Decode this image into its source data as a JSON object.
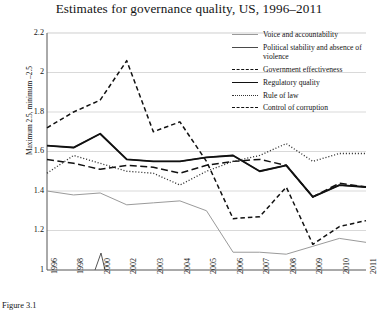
{
  "figure": {
    "caption": "Figure 3.1",
    "title": "Estimates for governance quality, US, 1996–2011"
  },
  "axes": {
    "ylabel": "Maximum 2.5, minimum –2.5",
    "yticks": [
      "2.2",
      "2",
      "1.8",
      "1.6",
      "1.4",
      "1.2",
      "1"
    ],
    "xticks": [
      "1996",
      "1998",
      "2000",
      "2002",
      "2003",
      "2004",
      "2005",
      "2006",
      "2007",
      "2008",
      "2009",
      "2010",
      "2011"
    ],
    "axis_break_marker": "zigzag"
  },
  "chart_data": {
    "type": "line",
    "title": "Estimates for governance quality, US, 1996–2011",
    "xlabel": "",
    "ylabel": "Maximum 2.5, minimum –2.5",
    "ylim": [
      1,
      2.2
    ],
    "ytick_values": [
      2.2,
      2.0,
      1.8,
      1.6,
      1.4,
      1.2,
      1.0
    ],
    "grid": "horizontal",
    "legend_position": "top-right inside",
    "categories": [
      "1996",
      "1998",
      "2000",
      "2002",
      "2003",
      "2004",
      "2005",
      "2006",
      "2007",
      "2008",
      "2009",
      "2010",
      "2011"
    ],
    "series": [
      {
        "name": "Voice and accountability",
        "style": "solid",
        "color": "#9a9a9a",
        "width": 1.0,
        "values": [
          1.4,
          1.38,
          1.39,
          1.33,
          1.34,
          1.35,
          1.3,
          1.09,
          1.09,
          1.08,
          1.12,
          1.16,
          1.14
        ]
      },
      {
        "name": "Political stability and absence of violence",
        "style": "solid",
        "color": "#4a4a4a",
        "width": 1.3,
        "values": [
          1.63,
          1.62,
          1.69,
          1.56,
          1.55,
          1.55,
          1.57,
          1.58,
          1.5,
          1.53,
          1.37,
          1.43,
          1.42
        ]
      },
      {
        "name": "Government effectiveness",
        "style": "dashed-long",
        "color": "#111111",
        "width": 1.5,
        "values": [
          1.56,
          1.54,
          1.51,
          1.53,
          1.52,
          1.49,
          1.53,
          1.55,
          1.56,
          1.53,
          1.37,
          1.44,
          1.42
        ]
      },
      {
        "name": "Regulatory quality",
        "style": "solid",
        "color": "#111111",
        "width": 1.9,
        "values": [
          1.63,
          1.62,
          1.69,
          1.56,
          1.55,
          1.55,
          1.57,
          1.58,
          1.5,
          1.53,
          1.37,
          1.43,
          1.42
        ]
      },
      {
        "name": "Rule of law",
        "style": "dotted",
        "color": "#333333",
        "width": 1.3,
        "values": [
          1.49,
          1.58,
          1.54,
          1.5,
          1.49,
          1.43,
          1.5,
          1.55,
          1.58,
          1.64,
          1.55,
          1.59,
          1.59
        ]
      },
      {
        "name": "Control of corruption",
        "style": "dashed-short",
        "color": "#111111",
        "width": 1.5,
        "values": [
          1.72,
          1.8,
          1.86,
          2.06,
          1.7,
          1.75,
          1.55,
          1.26,
          1.27,
          1.42,
          1.13,
          1.22,
          1.25
        ]
      }
    ]
  }
}
